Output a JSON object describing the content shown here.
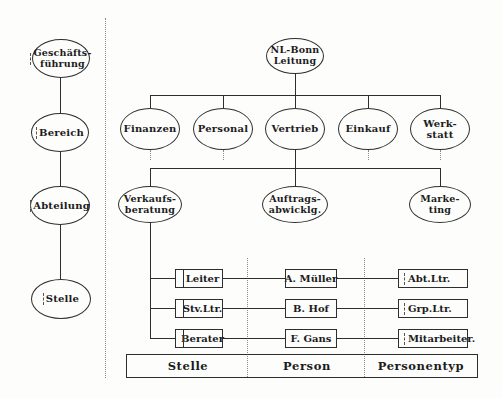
{
  "figure_kind": "scanned organization-structure diagram",
  "type_hierarchy": {
    "items": [
      {
        "label": "Geschäfts-\nführung"
      },
      {
        "label": "Bereich"
      },
      {
        "label": "Abteilung"
      },
      {
        "label": "Stelle"
      }
    ]
  },
  "org_chart": {
    "root": {
      "label": "NL-Bonn\nLeitung"
    },
    "departments": [
      {
        "label": "Finanzen"
      },
      {
        "label": "Personal"
      },
      {
        "label": "Vertrieb"
      },
      {
        "label": "Einkauf"
      },
      {
        "label": "Werk-\nstatt"
      }
    ],
    "subunits": [
      {
        "label": "Verkaufs-\nberatung"
      },
      {
        "label": "Auftrags-\nabwicklg."
      },
      {
        "label": "Marke-\nting"
      }
    ],
    "position_rows": [
      {
        "stelle": "Leiter",
        "person": "A. Müller",
        "personentyp": "Abt.Ltr."
      },
      {
        "stelle": "Stv.Ltr.",
        "person": "B. Hof",
        "personentyp": "Grp.Ltr."
      },
      {
        "stelle": "Berater",
        "person": "F. Gans",
        "personentyp": "Mitarbeiter."
      }
    ],
    "footer": {
      "col1": "Stelle",
      "col2": "Person",
      "col3": "Personentyp"
    }
  },
  "colors": {
    "background": "#fdfdfc",
    "line": "#2e2e2e",
    "dotted_line": "#8a8a8a",
    "text": "#1c1c1c"
  }
}
